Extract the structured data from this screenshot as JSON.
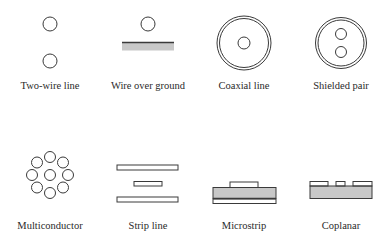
{
  "colors": {
    "stroke": "#3a3a3a",
    "dielectric": "#c8c8c8",
    "background": "#ffffff"
  },
  "items": [
    {
      "id": "two-wire-line",
      "label": "Two-wire line",
      "x": 50,
      "label_y": 80
    },
    {
      "id": "wire-over-ground",
      "label": "Wire over ground",
      "x": 148,
      "label_y": 80
    },
    {
      "id": "coaxial-line",
      "label": "Coaxial line",
      "x": 244,
      "label_y": 80
    },
    {
      "id": "shielded-pair",
      "label": "Shielded pair",
      "x": 341,
      "label_y": 80
    },
    {
      "id": "multiconductor",
      "label": "Multiconductor",
      "x": 50,
      "label_y": 220
    },
    {
      "id": "strip-line",
      "label": "Strip line",
      "x": 148,
      "label_y": 220
    },
    {
      "id": "microstrip",
      "label": "Microstrip",
      "x": 244,
      "label_y": 220
    },
    {
      "id": "coplanar",
      "label": "Coplanar",
      "x": 341,
      "label_y": 220
    }
  ]
}
